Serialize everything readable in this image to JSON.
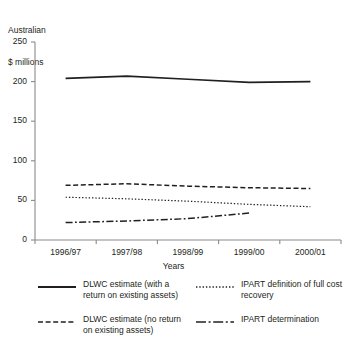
{
  "chart_data": {
    "type": "line",
    "title": "",
    "ylabel": "Australian\n$ millions",
    "ylabel_line1": "Australian",
    "ylabel_line2": "$ millions",
    "xlabel": "Years",
    "categories": [
      "1996/97",
      "1997/98",
      "1998/99",
      "1999/00",
      "2000/01"
    ],
    "ylim": [
      0,
      250
    ],
    "yticks": [
      0,
      50,
      100,
      150,
      200,
      250
    ],
    "ytick_labels": [
      "0",
      "50",
      "100",
      "150",
      "200",
      "250"
    ],
    "grid": false,
    "legend_position": "bottom",
    "series": [
      {
        "name": "DLWC estimate (with a return on existing assets)",
        "style": "solid",
        "color": "#231f20",
        "values": [
          204,
          207,
          203,
          199,
          200
        ]
      },
      {
        "name": "DLWC estimate (no return on existing assets)",
        "style": "dashed",
        "color": "#231f20",
        "values": [
          69,
          71,
          68,
          66,
          65
        ]
      },
      {
        "name": "IPART definition of full cost recovery",
        "style": "dotted",
        "color": "#231f20",
        "values": [
          54,
          52,
          49,
          45,
          42
        ]
      },
      {
        "name": "IPART determination",
        "style": "dashdot",
        "color": "#231f20",
        "values": [
          22,
          24,
          27,
          34,
          null
        ]
      }
    ]
  },
  "legend": {
    "entries": [
      {
        "label": "DLWC estimate (with a return on existing assets)",
        "style": "solid"
      },
      {
        "label": "IPART definition of full cost recovery",
        "style": "dotted"
      },
      {
        "label": "DLWC estimate (no return on existing assets)",
        "style": "dashed"
      },
      {
        "label": "IPART determination",
        "style": "dashdot"
      }
    ]
  },
  "axes": {
    "y_title_line1": "Australian",
    "y_title_line2": "$ millions",
    "x_title": "Years"
  },
  "colors": {
    "line": "#231f20",
    "axis": "#8a8a8a",
    "background": "#ffffff"
  }
}
